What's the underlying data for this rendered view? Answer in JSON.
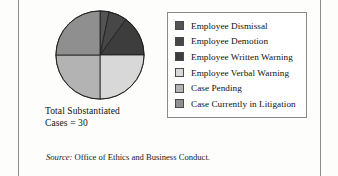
{
  "figure": {
    "caption_line1": "Total Substantiated",
    "caption_line2": "Cases = 30",
    "source_word": "Source:",
    "source_text": " Office of Ethics and Business Conduct."
  },
  "legend": {
    "items": [
      {
        "label": "Employee Dismissal",
        "color": "#545454",
        "swatch_name": "legend-swatch-employee-dismissal"
      },
      {
        "label": "Employee Demotion",
        "color": "#474747",
        "swatch_name": "legend-swatch-employee-demotion"
      },
      {
        "label": "Employee Written Warning",
        "color": "#3d3d3d",
        "swatch_name": "legend-swatch-employee-written-warning"
      },
      {
        "label": "Employee Verbal Warning",
        "color": "#d8d8d8",
        "swatch_name": "legend-swatch-employee-verbal-warning"
      },
      {
        "label": "Case Pending",
        "color": "#b3b3b3",
        "swatch_name": "legend-swatch-case-pending"
      },
      {
        "label": "Case Currently in Litigation",
        "color": "#8f8f8f",
        "swatch_name": "legend-swatch-case-currently-in-litigation"
      }
    ]
  },
  "chart_data": {
    "type": "pie",
    "title": "Total Substantiated Cases = 30",
    "total": 30,
    "unit": "cases",
    "start_angle": 0,
    "direction": "clockwise",
    "labels": [
      "Employee Dismissal",
      "Employee Demotion",
      "Employee Written Warning",
      "Employee Verbal Warning",
      "Case Pending",
      "Case Currently in Litigation"
    ],
    "values": [
      1,
      2,
      4.5,
      7.5,
      7.5,
      7.5
    ],
    "percentages": [
      3.3,
      6.7,
      15.0,
      25.0,
      25.0,
      25.0
    ],
    "colors": [
      "#545454",
      "#474747",
      "#3d3d3d",
      "#d8d8d8",
      "#b3b3b3",
      "#8f8f8f"
    ],
    "slice_edge_color": "#1c1c1c",
    "legend_position": "right",
    "grid": false,
    "source": "Source: Office of Ethics and Business Conduct."
  }
}
